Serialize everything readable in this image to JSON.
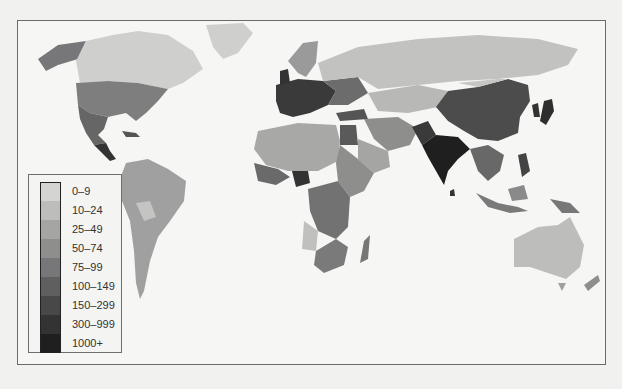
{
  "map": {
    "type": "choropleth",
    "projection": "world",
    "palette": [
      "#d4d4d2",
      "#bdbdbb",
      "#a5a5a3",
      "#8e8e8c",
      "#77777a",
      "#5f5f5f",
      "#484848",
      "#333333",
      "#1f1f1f"
    ]
  },
  "legend": {
    "items": [
      {
        "label": "0–9",
        "color": "#d4d4d2"
      },
      {
        "label": "10–24",
        "color": "#bdbdbb"
      },
      {
        "label": "25–49",
        "color": "#a5a5a3"
      },
      {
        "label": "50–74",
        "color": "#8e8e8c"
      },
      {
        "label": "75–99",
        "color": "#77777a"
      },
      {
        "label": "100–149",
        "color": "#5f5f5f"
      },
      {
        "label": "150–299",
        "color": "#484848"
      },
      {
        "label": "300–999",
        "color": "#333333"
      },
      {
        "label": "1000+",
        "color": "#1f1f1f"
      }
    ]
  },
  "regions": [
    {
      "name": "Alaska",
      "class": "75–99"
    },
    {
      "name": "Canada",
      "class": "0–9"
    },
    {
      "name": "Greenland",
      "class": "0–9"
    },
    {
      "name": "United States",
      "class": "75–99"
    },
    {
      "name": "Mexico",
      "class": "100–149"
    },
    {
      "name": "Central America",
      "class": "300–999"
    },
    {
      "name": "South America",
      "class": "25–49"
    },
    {
      "name": "Western Europe",
      "class": "300–999"
    },
    {
      "name": "Russia",
      "class": "10–24"
    },
    {
      "name": "North Africa",
      "class": "25–49"
    },
    {
      "name": "Egypt",
      "class": "100–149"
    },
    {
      "name": "Nigeria",
      "class": "300–999"
    },
    {
      "name": "Central Africa",
      "class": "75–99"
    },
    {
      "name": "Southern Africa",
      "class": "50–74"
    },
    {
      "name": "Madagascar",
      "class": "75–99"
    },
    {
      "name": "Middle East",
      "class": "50–74"
    },
    {
      "name": "India",
      "class": "1000+"
    },
    {
      "name": "China",
      "class": "150–299"
    },
    {
      "name": "Japan",
      "class": "300–999"
    },
    {
      "name": "Southeast Asia",
      "class": "100–149"
    },
    {
      "name": "Australia",
      "class": "10–24"
    },
    {
      "name": "New Zealand",
      "class": "50–74"
    }
  ]
}
